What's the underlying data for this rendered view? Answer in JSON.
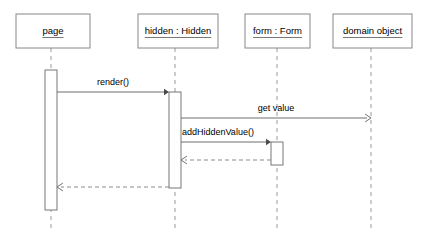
{
  "diagram": {
    "type": "uml-sequence-diagram",
    "participants": [
      {
        "id": "page",
        "label": "page",
        "lifeline_x": 51,
        "box": {
          "x": 16,
          "y": 14,
          "w": 74,
          "h": 34
        }
      },
      {
        "id": "hidden",
        "label": "hidden : Hidden",
        "lifeline_x": 175,
        "box": {
          "x": 138,
          "y": 14,
          "w": 80,
          "h": 34
        }
      },
      {
        "id": "form",
        "label": "form : Form",
        "lifeline_x": 277,
        "box": {
          "x": 245,
          "y": 14,
          "w": 65,
          "h": 34
        }
      },
      {
        "id": "domain_object",
        "label": "domain object",
        "lifeline_x": 371,
        "box": {
          "x": 333,
          "y": 14,
          "w": 79,
          "h": 34
        }
      }
    ],
    "lifeline_bottom": 231,
    "activations": [
      {
        "id": "page-activation",
        "owner": "page",
        "x": 45,
        "y": 70,
        "w": 12,
        "h": 140
      },
      {
        "id": "hidden-activation",
        "owner": "hidden",
        "x": 169,
        "y": 92,
        "w": 12,
        "h": 96
      },
      {
        "id": "form-activation",
        "owner": "form",
        "x": 271,
        "y": 142,
        "w": 12,
        "h": 23
      }
    ],
    "messages": [
      {
        "id": "render",
        "label": "render()",
        "kind": "call",
        "style": "solid",
        "arrow": "filled",
        "from": "page",
        "to": "hidden",
        "x1": 57,
        "x2": 169,
        "y": 92,
        "label_x": 113,
        "label_y": 85
      },
      {
        "id": "get-value",
        "label": "get value",
        "kind": "call",
        "style": "solid",
        "arrow": "open",
        "from": "hidden",
        "to": "domain_object",
        "x1": 181,
        "x2": 371,
        "y": 118,
        "label_x": 276,
        "label_y": 111
      },
      {
        "id": "add-hidden-value",
        "label": "addHiddenValue()",
        "kind": "call",
        "style": "solid",
        "arrow": "filled",
        "from": "hidden",
        "to": "form",
        "x1": 181,
        "x2": 271,
        "y": 142,
        "label_x": 182,
        "label_y": 135
      },
      {
        "id": "form-return",
        "label": "",
        "kind": "return",
        "style": "dashed",
        "arrow": "open",
        "from": "form",
        "to": "hidden",
        "x1": 271,
        "x2": 181,
        "y": 160,
        "label_x": 226,
        "label_y": 154
      },
      {
        "id": "hidden-return",
        "label": "",
        "kind": "return",
        "style": "dashed",
        "arrow": "open",
        "from": "hidden",
        "to": "page",
        "x1": 169,
        "x2": 57,
        "y": 187,
        "label_x": 113,
        "label_y": 181
      }
    ]
  }
}
